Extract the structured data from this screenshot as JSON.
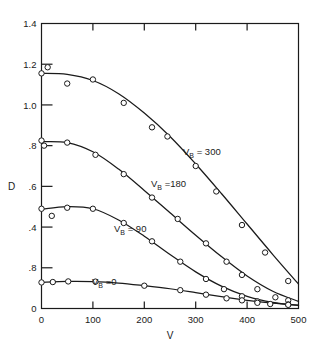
{
  "figure": {
    "background": "#ffffff",
    "ink": "#1a1a1a",
    "width": 316,
    "height": 346
  },
  "axes": {
    "y_title": "D",
    "x_title": "V",
    "y_tick_labels": [
      "1.4",
      "1.2",
      "1.0",
      ".8",
      ".6",
      ".4",
      ".8",
      "0"
    ],
    "x_tick_labels": [
      "0",
      "100",
      "200",
      "300",
      "400",
      "500"
    ]
  },
  "labels": {
    "c300": {
      "prefix": "V",
      "sub": "B",
      "value": "= 300"
    },
    "c180": {
      "prefix": "V",
      "sub": "B",
      "value": "=180"
    },
    "c90": {
      "prefix": "V",
      "sub": "B",
      "value": "= 90"
    },
    "c0": {
      "prefix": "V",
      "sub": "B",
      "value": "=0"
    }
  },
  "chart_data": {
    "type": "scatter",
    "title": "",
    "xlabel": "V",
    "ylabel": "D",
    "xlim": [
      0,
      500
    ],
    "ylim": [
      0,
      1.4
    ],
    "xticks": [
      0,
      100,
      200,
      300,
      400,
      500
    ],
    "yticks": [
      0,
      0.2,
      0.4,
      0.6,
      0.8,
      1.0,
      1.2,
      1.4
    ],
    "ytick_labels_as_printed": [
      "0",
      ".8",
      ".4",
      ".6",
      ".8",
      "1.0",
      "1.2",
      "1.4"
    ],
    "ytick_label_note": "The 0.2 gridline is printed as '.8' in the original figure (typographic error).",
    "grid": false,
    "legend": "inline curve annotations",
    "marker": "open circle",
    "series": [
      {
        "name": "V_B = 300",
        "label": "V_B = 300",
        "points": [
          {
            "x": 0,
            "y": 1.155
          },
          {
            "x": 12,
            "y": 1.185
          },
          {
            "x": 50,
            "y": 1.105
          },
          {
            "x": 100,
            "y": 1.125
          },
          {
            "x": 160,
            "y": 1.01
          },
          {
            "x": 215,
            "y": 0.89
          },
          {
            "x": 245,
            "y": 0.845
          },
          {
            "x": 300,
            "y": 0.7
          },
          {
            "x": 340,
            "y": 0.575
          },
          {
            "x": 390,
            "y": 0.41
          },
          {
            "x": 435,
            "y": 0.275
          },
          {
            "x": 480,
            "y": 0.135
          }
        ],
        "fit": [
          {
            "x": 0,
            "y": 1.155
          },
          {
            "x": 50,
            "y": 1.15
          },
          {
            "x": 100,
            "y": 1.12
          },
          {
            "x": 150,
            "y": 1.055
          },
          {
            "x": 200,
            "y": 0.96
          },
          {
            "x": 250,
            "y": 0.845
          },
          {
            "x": 300,
            "y": 0.71
          },
          {
            "x": 350,
            "y": 0.565
          },
          {
            "x": 400,
            "y": 0.415
          },
          {
            "x": 450,
            "y": 0.265
          },
          {
            "x": 500,
            "y": 0.12
          }
        ]
      },
      {
        "name": "V_B = 180",
        "label": "V_B =180",
        "points": [
          {
            "x": 0,
            "y": 0.825
          },
          {
            "x": 5,
            "y": 0.8
          },
          {
            "x": 50,
            "y": 0.815
          },
          {
            "x": 105,
            "y": 0.755
          },
          {
            "x": 160,
            "y": 0.66
          },
          {
            "x": 215,
            "y": 0.545
          },
          {
            "x": 265,
            "y": 0.44
          },
          {
            "x": 320,
            "y": 0.32
          },
          {
            "x": 360,
            "y": 0.23
          },
          {
            "x": 390,
            "y": 0.165
          },
          {
            "x": 420,
            "y": 0.095
          },
          {
            "x": 455,
            "y": 0.055
          },
          {
            "x": 480,
            "y": 0.04
          }
        ],
        "fit": [
          {
            "x": 0,
            "y": 0.82
          },
          {
            "x": 50,
            "y": 0.815
          },
          {
            "x": 100,
            "y": 0.77
          },
          {
            "x": 150,
            "y": 0.685
          },
          {
            "x": 200,
            "y": 0.58
          },
          {
            "x": 250,
            "y": 0.47
          },
          {
            "x": 300,
            "y": 0.36
          },
          {
            "x": 350,
            "y": 0.255
          },
          {
            "x": 400,
            "y": 0.16
          },
          {
            "x": 450,
            "y": 0.085
          },
          {
            "x": 500,
            "y": 0.035
          }
        ]
      },
      {
        "name": "V_B = 90",
        "label": "V_B = 90",
        "points": [
          {
            "x": 0,
            "y": 0.49
          },
          {
            "x": 20,
            "y": 0.455
          },
          {
            "x": 50,
            "y": 0.495
          },
          {
            "x": 100,
            "y": 0.49
          },
          {
            "x": 160,
            "y": 0.42
          },
          {
            "x": 215,
            "y": 0.33
          },
          {
            "x": 270,
            "y": 0.23
          },
          {
            "x": 320,
            "y": 0.145
          },
          {
            "x": 355,
            "y": 0.095
          },
          {
            "x": 390,
            "y": 0.06
          },
          {
            "x": 420,
            "y": 0.035
          },
          {
            "x": 480,
            "y": 0.02
          }
        ],
        "fit": [
          {
            "x": 0,
            "y": 0.487
          },
          {
            "x": 50,
            "y": 0.5
          },
          {
            "x": 100,
            "y": 0.49
          },
          {
            "x": 150,
            "y": 0.435
          },
          {
            "x": 200,
            "y": 0.355
          },
          {
            "x": 250,
            "y": 0.265
          },
          {
            "x": 300,
            "y": 0.18
          },
          {
            "x": 350,
            "y": 0.11
          },
          {
            "x": 400,
            "y": 0.06
          },
          {
            "x": 450,
            "y": 0.03
          },
          {
            "x": 500,
            "y": 0.015
          }
        ]
      },
      {
        "name": "V_B = 0",
        "label": "V_B =0",
        "points": [
          {
            "x": 0,
            "y": 0.128
          },
          {
            "x": 22,
            "y": 0.13
          },
          {
            "x": 52,
            "y": 0.133
          },
          {
            "x": 105,
            "y": 0.132
          },
          {
            "x": 200,
            "y": 0.112
          },
          {
            "x": 270,
            "y": 0.09
          },
          {
            "x": 320,
            "y": 0.068
          },
          {
            "x": 360,
            "y": 0.05
          },
          {
            "x": 390,
            "y": 0.04
          },
          {
            "x": 420,
            "y": 0.028
          },
          {
            "x": 445,
            "y": 0.022
          },
          {
            "x": 480,
            "y": 0.018
          }
        ],
        "fit": [
          {
            "x": 0,
            "y": 0.128
          },
          {
            "x": 50,
            "y": 0.133
          },
          {
            "x": 100,
            "y": 0.132
          },
          {
            "x": 150,
            "y": 0.125
          },
          {
            "x": 200,
            "y": 0.112
          },
          {
            "x": 250,
            "y": 0.097
          },
          {
            "x": 300,
            "y": 0.078
          },
          {
            "x": 350,
            "y": 0.058
          },
          {
            "x": 400,
            "y": 0.04
          },
          {
            "x": 450,
            "y": 0.026
          },
          {
            "x": 500,
            "y": 0.016
          }
        ]
      }
    ]
  }
}
